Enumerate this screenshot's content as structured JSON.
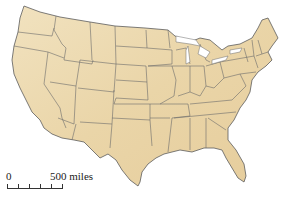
{
  "map": {
    "title": "United States map",
    "land_color": "#ecd9b0",
    "border_color": "#6b6b6b",
    "background": "#ffffff"
  },
  "scale": {
    "zero_label": "0",
    "distance_label": "500 miles",
    "ticks": 6
  }
}
